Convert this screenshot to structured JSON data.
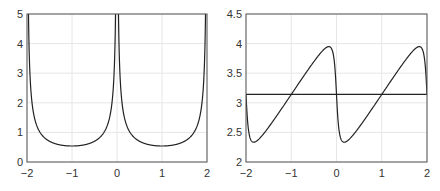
{
  "chart_data": [
    {
      "type": "line",
      "title": "",
      "xlabel": "",
      "ylabel": "",
      "xlim": [
        -2,
        2
      ],
      "ylim": [
        0,
        5
      ],
      "xticks": [
        -2,
        -1,
        0,
        1,
        2
      ],
      "yticks": [
        0,
        1,
        2,
        3,
        4,
        5
      ],
      "xtick_labels": [
        "−2",
        "−1",
        "0",
        "1",
        "2"
      ],
      "ytick_labels": [
        "0",
        "1",
        "2",
        "3",
        "4",
        "5"
      ],
      "grid": true,
      "legend": null,
      "series": [
        {
          "name": "curve",
          "color": "#222222",
          "description": "periodic (period 2) cusps at x=-2,0,2 rising above 5 (clipped), minima ~0.54 at x=-1 and x=1",
          "x": [
            -2,
            -1.96,
            -1.9,
            -1.87,
            -1.8,
            -1.67,
            -1.5,
            -1.25,
            -1,
            -0.75,
            -0.5,
            -0.33,
            -0.2,
            -0.13,
            -0.1,
            -0.04,
            0,
            0.04,
            0.1,
            0.13,
            0.2,
            0.33,
            0.5,
            0.75,
            1,
            1.25,
            1.5,
            1.67,
            1.8,
            1.87,
            1.9,
            1.96,
            2
          ],
          "y": [
            5,
            4.0,
            2.4,
            2.0,
            1.5,
            1.06,
            0.82,
            0.61,
            0.54,
            0.61,
            0.82,
            1.06,
            1.5,
            2.0,
            2.4,
            4.0,
            5,
            4.0,
            2.4,
            2.0,
            1.5,
            1.06,
            0.82,
            0.61,
            0.54,
            0.61,
            0.82,
            1.06,
            1.5,
            2.0,
            2.4,
            4.0,
            5
          ]
        }
      ],
      "plot_box_px": [
        27,
        14,
        207,
        162
      ]
    },
    {
      "type": "line",
      "title": "",
      "xlabel": "",
      "ylabel": "",
      "xlim": [
        -2,
        2
      ],
      "ylim": [
        2,
        4.5
      ],
      "xticks": [
        -2,
        -1,
        0,
        1,
        2
      ],
      "yticks": [
        2,
        2.5,
        3,
        3.5,
        4,
        4.5
      ],
      "xtick_labels": [
        "−2",
        "−1",
        "0",
        "1",
        "2"
      ],
      "ytick_labels": [
        "2",
        "2.5",
        "3",
        "3.5",
        "4",
        "4.5"
      ],
      "grid": true,
      "legend": null,
      "series": [
        {
          "name": "curve",
          "color": "#222222",
          "description": "periodic (period 2) smoothed sawtooth around pi; min ~2.23 near x=-1.8, 0.2; max ~4.05 near x=-0.2, 1.8",
          "x": [
            -2,
            -1.95,
            -1.9,
            -1.8,
            -1.7,
            -1.5,
            -1.25,
            -1,
            -0.75,
            -0.5,
            -0.3,
            -0.2,
            -0.1,
            -0.05,
            0,
            0.05,
            0.1,
            0.2,
            0.3,
            0.5,
            0.75,
            1,
            1.25,
            1.5,
            1.7,
            1.8,
            1.9,
            1.95,
            2
          ],
          "y": [
            3.14,
            2.55,
            2.3,
            2.23,
            2.28,
            2.58,
            2.86,
            3.14,
            3.42,
            3.7,
            3.98,
            4.05,
            4.0,
            3.75,
            3.14,
            2.55,
            2.3,
            2.23,
            2.28,
            2.58,
            2.86,
            3.14,
            3.42,
            3.7,
            3.98,
            4.05,
            4.0,
            3.75,
            3.14
          ]
        },
        {
          "name": "constant",
          "color": "#222222",
          "description": "horizontal reference line at y = pi",
          "x": [
            -2,
            2
          ],
          "y": [
            3.1416,
            3.1416
          ]
        }
      ],
      "plot_box_px": [
        246,
        14,
        427,
        162
      ]
    }
  ],
  "style": {
    "axis_color": "#555555",
    "grid_color": "#e6e6e6",
    "line_color": "#222222",
    "background": "#ffffff"
  }
}
